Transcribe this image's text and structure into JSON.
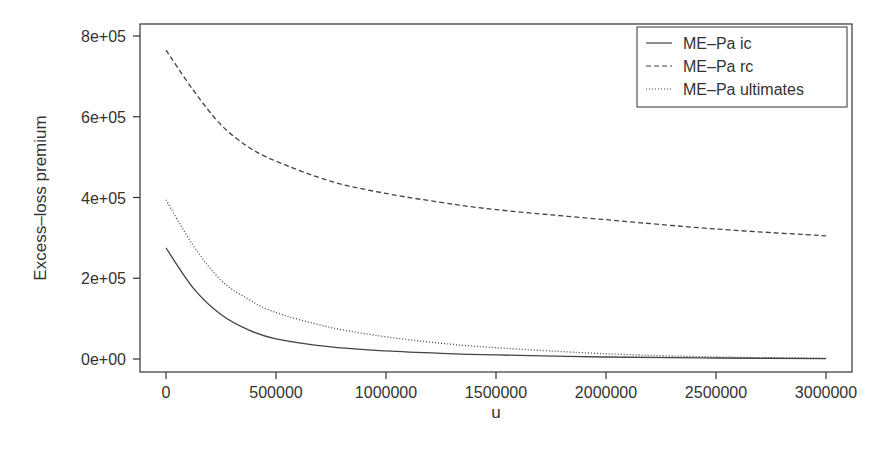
{
  "chart_data": {
    "type": "line",
    "title": "",
    "xlabel": "u",
    "ylabel": "Excess–loss premium",
    "xlim": [
      0,
      3000000
    ],
    "ylim": [
      0,
      800000
    ],
    "grid": false,
    "legend_position": "top-right",
    "x_ticks": [
      0,
      500000,
      1000000,
      1500000,
      2000000,
      2500000,
      3000000
    ],
    "x_tick_labels": [
      "0",
      "500000",
      "1000000",
      "1500000",
      "2000000",
      "2500000",
      "3000000"
    ],
    "y_ticks": [
      0,
      200000,
      400000,
      600000,
      800000
    ],
    "y_tick_labels": [
      "0e+00",
      "2e+05",
      "4e+05",
      "6e+05",
      "8e+05"
    ],
    "x": [
      0,
      125000,
      250000,
      375000,
      500000,
      750000,
      1000000,
      1250000,
      1500000,
      2000000,
      2500000,
      3000000
    ],
    "series": [
      {
        "name": "ME–Pa ic",
        "line_style": "solid",
        "values": [
          275000,
          175000,
          110000,
          72000,
          50000,
          30000,
          20000,
          14000,
          10000,
          5000,
          2500,
          1000
        ]
      },
      {
        "name": "ME–Pa rc",
        "line_style": "dashed",
        "values": [
          765000,
          665000,
          580000,
          525000,
          490000,
          440000,
          410000,
          388000,
          370000,
          345000,
          322000,
          305000
        ]
      },
      {
        "name": "ME–Pa ultimates",
        "line_style": "dotted",
        "values": [
          394000,
          280000,
          195000,
          148000,
          115000,
          78000,
          55000,
          39000,
          28000,
          13000,
          5000,
          2000
        ]
      }
    ]
  },
  "legend": {
    "items": [
      {
        "label": "ME–Pa ic"
      },
      {
        "label": "ME–Pa rc"
      },
      {
        "label": "ME–Pa ultimates"
      }
    ]
  },
  "axes": {
    "xlabel": "u",
    "ylabel": "Excess–loss premium"
  },
  "colors": {
    "line": "#444444",
    "axis": "#333333",
    "background": "#ffffff"
  }
}
